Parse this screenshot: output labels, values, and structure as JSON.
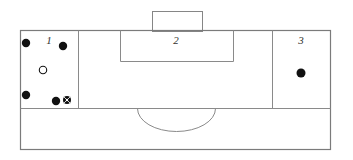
{
  "diagram": {
    "type": "schematic-line-drawing",
    "canvas": {
      "width": 353,
      "height": 160
    },
    "stroke_color": "#808080",
    "stroke_color_dark": "#5a5a5a",
    "marker_fill_color": "#111111",
    "marker_outline_color": "#111111",
    "background_color": "#ffffff",
    "outer_boundary": {
      "label": "outer-boundary",
      "x": 20,
      "y": 30,
      "width": 310,
      "height": 120
    },
    "upper_band": {
      "label": "upper-band",
      "y_top": 30,
      "y_bottom": 108
    },
    "lower_band": {
      "label": "lower-band",
      "y_top": 108,
      "y_bottom": 150
    },
    "dividers": [
      {
        "name": "divider-zone1-zone2",
        "x": 78,
        "y_top": 30,
        "y_bottom": 108
      },
      {
        "name": "divider-zone2-zone3",
        "x": 272,
        "y_top": 30,
        "y_bottom": 108
      },
      {
        "name": "horizontal-midline",
        "y": 108,
        "x_left": 20,
        "x_right": 330
      }
    ],
    "zones": [
      {
        "id": "zone-1",
        "number": "1",
        "label_x": 49,
        "label_y": 44,
        "x": 20,
        "y": 30,
        "width": 58,
        "height": 78
      },
      {
        "id": "zone-2",
        "number": "2",
        "label_x": 176,
        "label_y": 44,
        "x": 78,
        "y": 30,
        "width": 194,
        "height": 78
      },
      {
        "id": "zone-3",
        "number": "3",
        "label_x": 301,
        "label_y": 44,
        "x": 272,
        "y": 30,
        "width": 58,
        "height": 78
      }
    ],
    "top_rectangle": {
      "name": "top-protruding-rectangle",
      "x": 152,
      "y": 11,
      "width": 50,
      "height": 20
    },
    "inner_rectangle": {
      "name": "zone2-inner-rectangle",
      "x": 120,
      "y": 31,
      "width": 113,
      "height": 30
    },
    "arc": {
      "name": "semicircular-arc",
      "center_x": 176,
      "center_y": 108,
      "radius_x": 39,
      "radius_y": 23,
      "direction": "downward"
    },
    "markers": [
      {
        "id": "marker-1",
        "zone": "zone-1",
        "kind": "filled-circle",
        "cx": 26,
        "cy": 43,
        "r": 4.2
      },
      {
        "id": "marker-2",
        "zone": "zone-1",
        "kind": "filled-circle",
        "cx": 63,
        "cy": 46,
        "r": 4.2
      },
      {
        "id": "marker-3",
        "zone": "zone-1",
        "kind": "hollow-circle",
        "cx": 43,
        "cy": 70,
        "r": 4.0
      },
      {
        "id": "marker-4",
        "zone": "zone-1",
        "kind": "filled-circle",
        "cx": 26,
        "cy": 95,
        "r": 4.2
      },
      {
        "id": "marker-5",
        "zone": "zone-1",
        "kind": "filled-circle",
        "cx": 56,
        "cy": 101,
        "r": 4.2
      },
      {
        "id": "marker-6",
        "zone": "zone-1",
        "kind": "crosshair-circle",
        "cx": 67,
        "cy": 100,
        "r": 4.0
      },
      {
        "id": "marker-7",
        "zone": "zone-3",
        "kind": "filled-circle",
        "cx": 301,
        "cy": 73,
        "r": 4.5
      }
    ],
    "marker_legend": {
      "filled-circle": "solid marker",
      "hollow-circle": "open marker",
      "crosshair-circle": "crosshair / wheel marker"
    }
  }
}
